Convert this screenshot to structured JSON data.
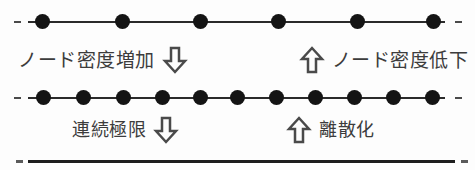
{
  "figure": {
    "background_color": "#fdfdfd",
    "ink_color": "#141414",
    "text_color": "#3c3c3c"
  },
  "lattices": [
    {
      "name": "coarse-lattice",
      "node_count": 6,
      "node_positions": [
        42,
        122,
        200,
        278,
        357,
        433
      ],
      "spacing": 78
    },
    {
      "name": "fine-lattice",
      "node_count": 11,
      "node_positions": [
        43,
        83,
        123,
        162,
        200,
        237,
        276,
        315,
        354,
        393,
        432
      ],
      "spacing": 39
    }
  ],
  "continuum": {
    "name": "continuum-line",
    "node_count": 0
  },
  "annotations": {
    "upper": {
      "left": {
        "label": "ノード密度増加",
        "arrow": "arrow-down-icon",
        "arrow_direction": "down",
        "order": "label-then-arrow"
      },
      "right": {
        "label": "ノード密度低下",
        "arrow": "arrow-up-icon",
        "arrow_direction": "up",
        "order": "arrow-then-label"
      }
    },
    "lower": {
      "left": {
        "label": "連続極限",
        "arrow": "arrow-down-icon",
        "arrow_direction": "down",
        "order": "label-then-arrow"
      },
      "right": {
        "label": "離散化",
        "arrow": "arrow-up-icon",
        "arrow_direction": "up",
        "order": "arrow-then-label"
      }
    }
  }
}
